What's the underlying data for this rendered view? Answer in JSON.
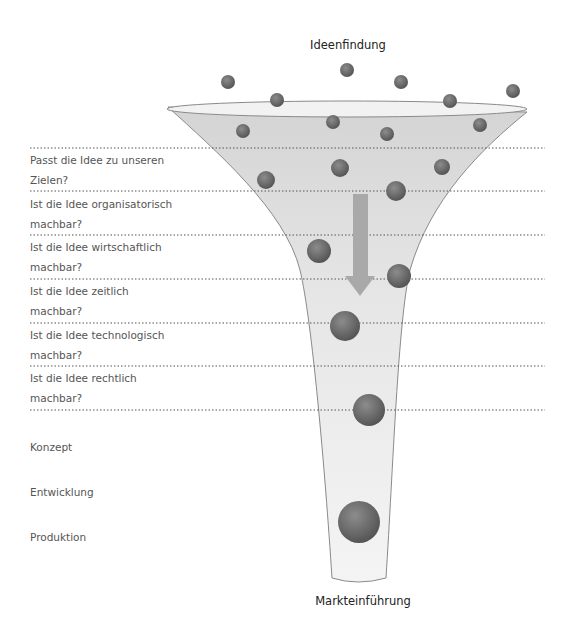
{
  "diagram": {
    "type": "funnel",
    "top_label": "Ideenfindung",
    "bottom_label": "Markteinführung",
    "questions": [
      {
        "line1": "Passt die Idee zu unseren",
        "line2": "Zielen?"
      },
      {
        "line1": "Ist die Idee organisatorisch",
        "line2": "machbar?"
      },
      {
        "line1": "Ist die Idee wirtschaftlich",
        "line2": "machbar?"
      },
      {
        "line1": "Ist die Idee zeitlich",
        "line2": "machbar?"
      },
      {
        "line1": "Ist die Idee technologisch",
        "line2": "machbar?"
      },
      {
        "line1": "Ist die Idee rechtlich",
        "line2": "machbar?"
      }
    ],
    "stages": [
      "Konzept",
      "Entwicklung",
      "Produktion"
    ],
    "colors": {
      "funnel_fill": "#e4e4e4",
      "funnel_stroke": "#8a8a8a",
      "ball": "#6e6e6e",
      "arrow": "#a8a8a8",
      "dotted_line": "#555555"
    },
    "direction_arrow": "arrow-down"
  }
}
